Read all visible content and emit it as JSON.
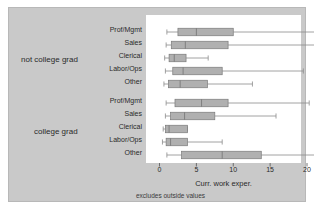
{
  "figure": {
    "background_color": "#c9c9c9",
    "plot_background_color": "#ffffff",
    "box_fill_color": "#b0b0b0",
    "box_edge_color": "#7a7a7a",
    "whisker_color": "#8a8a8a",
    "axis_title": "Curr. work exper.",
    "footnote": "excludes outside values"
  },
  "chart_data": {
    "type": "box",
    "title": "",
    "xlabel": "Curr. work exper.",
    "ylabel": "",
    "xlim": [
      0,
      22.5
    ],
    "xticks": [
      0,
      5,
      10,
      15,
      20
    ],
    "xtick_labels": [
      "0",
      "5",
      "10",
      "15",
      "20"
    ],
    "grid": false,
    "legend": "none",
    "annotation": "excludes outside values",
    "groups": [
      {
        "name": "not college grad",
        "categories": [
          "Prof/Mgmt",
          "Sales",
          "Clerical",
          "Labor/Ops",
          "Other"
        ],
        "boxes": [
          {
            "category": "Prof/Mgmt",
            "whisker_low": 1.0,
            "q1": 2.5,
            "median": 5.0,
            "q3": 10.0,
            "whisker_high": 21.5
          },
          {
            "category": "Sales",
            "whisker_low": 0.9,
            "q1": 1.6,
            "median": 3.5,
            "q3": 9.3,
            "whisker_high": 21.3
          },
          {
            "category": "Clerical",
            "whisker_low": 0.7,
            "q1": 1.3,
            "median": 2.0,
            "q3": 3.6,
            "whisker_high": 6.6
          },
          {
            "category": "Labor/Ops",
            "whisker_low": 0.8,
            "q1": 1.8,
            "median": 3.2,
            "q3": 8.5,
            "whisker_high": 19.5
          },
          {
            "category": "Other",
            "whisker_low": 0.6,
            "q1": 1.2,
            "median": 2.8,
            "q3": 6.5,
            "whisker_high": 12.6
          }
        ]
      },
      {
        "name": "college grad",
        "categories": [
          "Prof/Mgmt",
          "Sales",
          "Clerical",
          "Labor/Ops",
          "Other"
        ],
        "boxes": [
          {
            "category": "Prof/Mgmt",
            "whisker_low": 0.9,
            "q1": 2.1,
            "median": 5.7,
            "q3": 9.3,
            "whisker_high": 20.3
          },
          {
            "category": "Sales",
            "whisker_low": 0.8,
            "q1": 1.5,
            "median": 3.4,
            "q3": 7.5,
            "whisker_high": 15.8
          },
          {
            "category": "Clerical",
            "whisker_low": 0.5,
            "q1": 0.8,
            "median": 1.3,
            "q3": 3.8,
            "whisker_high": 3.8
          },
          {
            "category": "Labor/Ops",
            "whisker_low": 0.4,
            "q1": 0.9,
            "median": 1.5,
            "q3": 3.8,
            "whisker_high": 8.5
          },
          {
            "category": "Other",
            "whisker_low": 1.0,
            "q1": 3.0,
            "median": 8.5,
            "q3": 13.8,
            "whisker_high": 21.8
          }
        ]
      }
    ]
  },
  "labels": {
    "group_0": "not college grad",
    "group_1": "college grad",
    "categories_0": [
      "Prof/Mgmt",
      "Sales",
      "Clerical",
      "Labor/Ops",
      "Other"
    ],
    "categories_1": [
      "Prof/Mgmt",
      "Sales",
      "Clerical",
      "Labor/Ops",
      "Other"
    ],
    "ticks": [
      "0",
      "5",
      "10",
      "15",
      "20"
    ]
  }
}
